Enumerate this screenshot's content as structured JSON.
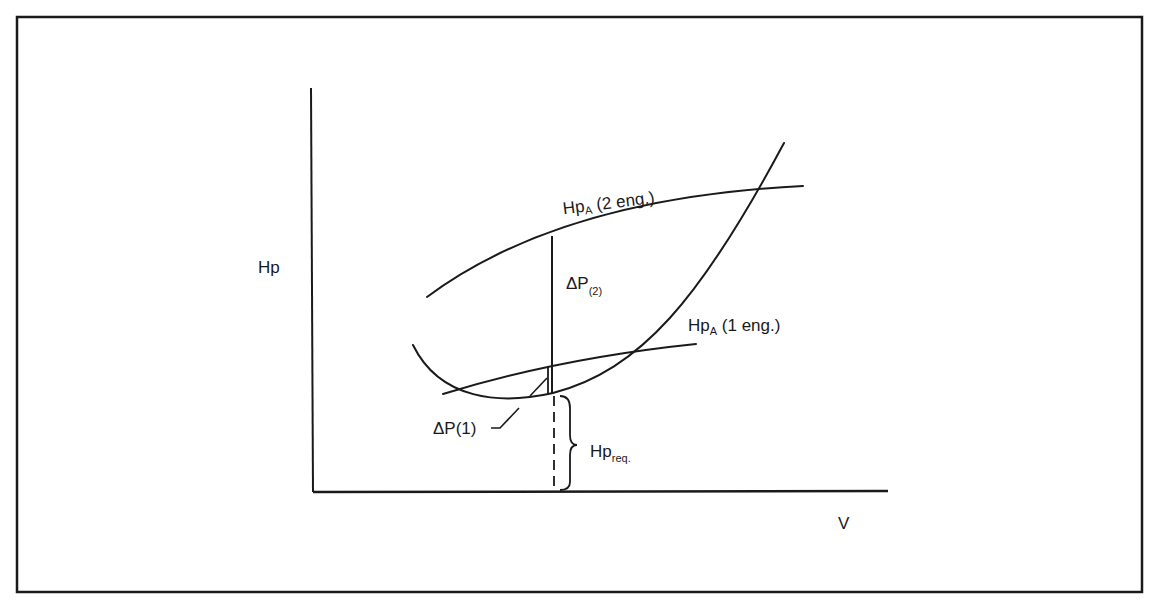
{
  "figure": {
    "y_axis_label": "Hp",
    "x_axis_label": "V",
    "curves": [
      {
        "name": "power-available-2-engines",
        "label_main": "Hp",
        "label_sub": "A",
        "label_suffix": " (2 eng.)"
      },
      {
        "name": "power-available-1-engine",
        "label_main": "Hp",
        "label_sub": "A",
        "label_suffix": " (1 eng.)"
      },
      {
        "name": "power-required",
        "label_main": "Hp",
        "label_sub": "req."
      }
    ],
    "annotations": {
      "delta_p2_main": "ΔP",
      "delta_p2_sub": "(2)",
      "delta_p1": "ΔP(1)"
    },
    "colors": {
      "ink": "#1a1a1a",
      "background": "#ffffff"
    }
  }
}
